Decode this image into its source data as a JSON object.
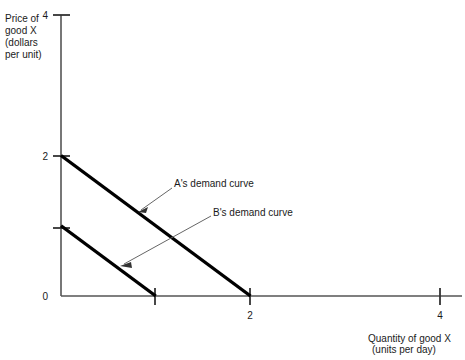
{
  "chart_data": {
    "type": "line",
    "title": "",
    "xlabel": "Quantity of good X (units per day)",
    "ylabel": "Price of good X (dollars per unit)",
    "xlim": [
      0,
      4.25
    ],
    "ylim": [
      0,
      4.2
    ],
    "grid": false,
    "legend_position": "inline-annotations",
    "xticks": [
      {
        "value": 0,
        "label": ""
      },
      {
        "value": 1,
        "label": ""
      },
      {
        "value": 2,
        "label": "2"
      },
      {
        "value": 4,
        "label": "4"
      }
    ],
    "yticks": [
      {
        "value": 0,
        "label": "0"
      },
      {
        "value": 1,
        "label": ""
      },
      {
        "value": 2,
        "label": "2"
      },
      {
        "value": 4,
        "label": "4"
      }
    ],
    "series": [
      {
        "name": "A's demand curve",
        "points": [
          {
            "x": 0,
            "y": 2
          },
          {
            "x": 2,
            "y": 0
          }
        ],
        "color": "#000000"
      },
      {
        "name": "B's demand curve",
        "points": [
          {
            "x": 0,
            "y": 1
          },
          {
            "x": 1,
            "y": 0
          }
        ],
        "color": "#000000"
      }
    ],
    "annotations": [
      {
        "text": "A's demand curve",
        "target": {
          "x": 0.83,
          "y": 1.21
        },
        "label_at": {
          "x": 1.17,
          "y": 1.54
        }
      },
      {
        "text": "B's demand curve",
        "target": {
          "x": 0.64,
          "y": 0.44
        },
        "label_at": {
          "x": 1.58,
          "y": 1.14
        }
      }
    ]
  },
  "axes": {
    "y_caption_lines": [
      "Price of",
      "good X",
      "(dollars",
      "per unit)"
    ],
    "x_caption_lines": [
      "Quantity of good X",
      "(units per day)"
    ],
    "y_tick_top_label": "4",
    "y_tick_two_label": "2",
    "y_tick_zero_label": "0",
    "x_tick_two_label": "2",
    "x_tick_four_label": "4"
  },
  "annotations": {
    "curve_a_label": "A's demand curve",
    "curve_b_label": "B's demand curve"
  },
  "colors": {
    "axis": "#555555",
    "curve": "#000000",
    "text": "#1a1a1a",
    "leader": "#666666",
    "background": "#ffffff"
  }
}
